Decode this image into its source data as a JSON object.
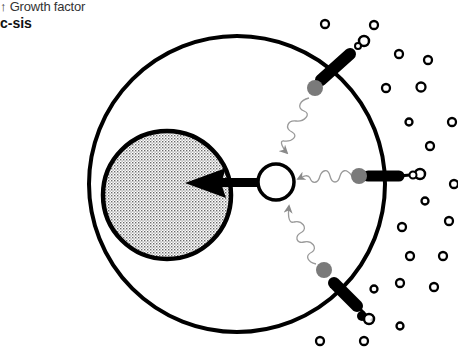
{
  "labels": {
    "indicator_line": "↑ Growth factor",
    "gene_name": "c-sis"
  },
  "diagram": {
    "type": "cell-signaling-schematic",
    "cell": {
      "cx": 237,
      "cy": 184,
      "r": 148,
      "stroke": "#000000"
    },
    "nucleus": {
      "cx": 167,
      "cy": 195,
      "r": 64,
      "fill": "stipple-grey"
    },
    "signal_hub": {
      "cx": 276,
      "cy": 182,
      "r": 18
    },
    "nuclear_arrow": {
      "from": [
        258,
        182
      ],
      "to": [
        185,
        183
      ]
    },
    "receptors": [
      {
        "name": "receptor-top",
        "ball": [
          315,
          88
        ],
        "body": [
          [
            325,
            76
          ],
          [
            353,
            52
          ]
        ],
        "ligand": [
          362,
          42
        ]
      },
      {
        "name": "receptor-right",
        "ball": [
          359,
          176
        ],
        "body": [
          [
            370,
            176
          ],
          [
            402,
            176
          ]
        ],
        "ligand": [
          417,
          174
        ]
      },
      {
        "name": "receptor-bottom",
        "ball": [
          324,
          269
        ],
        "body": [
          [
            333,
            281
          ],
          [
            360,
            309
          ]
        ],
        "ligand": [
          368,
          318
        ]
      }
    ],
    "growth_factor_particles": [
      [
        325,
        24
      ],
      [
        374,
        25
      ],
      [
        399,
        54
      ],
      [
        428,
        60
      ],
      [
        386,
        88
      ],
      [
        421,
        87
      ],
      [
        409,
        122
      ],
      [
        452,
        122
      ],
      [
        430,
        146
      ],
      [
        454,
        184
      ],
      [
        425,
        201
      ],
      [
        402,
        227
      ],
      [
        449,
        221
      ],
      [
        410,
        256
      ],
      [
        443,
        256
      ],
      [
        400,
        283
      ],
      [
        434,
        287
      ],
      [
        374,
        289
      ],
      [
        372,
        320
      ],
      [
        400,
        326
      ],
      [
        320,
        341
      ],
      [
        364,
        341
      ]
    ],
    "colors": {
      "line": "#000000",
      "receptor_ball": "#7a7a7a",
      "signal_wave": "#9a9a9a",
      "nucleus_dot": "#8a8a8a"
    }
  }
}
